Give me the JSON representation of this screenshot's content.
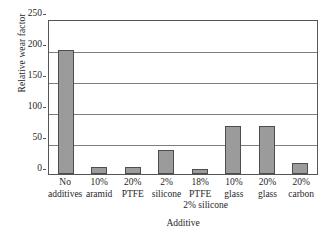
{
  "chart_data": {
    "type": "bar",
    "title": "",
    "xlabel": "Additive",
    "ylabel": "Relative wear factor",
    "categories": [
      "No additives",
      "10% aramid",
      "20% PTFE",
      "2% silicone",
      "18% PTFE 2% silicone",
      "10% glass",
      "20% glass",
      "20% carbon"
    ],
    "category_lines": [
      {
        "l1": "No",
        "l2": "additives",
        "l3": ""
      },
      {
        "l1": "10%",
        "l2": "aramid",
        "l3": ""
      },
      {
        "l1": "20%",
        "l2": "PTFE",
        "l3": ""
      },
      {
        "l1": "2%",
        "l2": "silicone",
        "l3": ""
      },
      {
        "l1": "18%",
        "l2": "PTFE",
        "l3": "2% silicone"
      },
      {
        "l1": "10%",
        "l2": "glass",
        "l3": ""
      },
      {
        "l1": "20%",
        "l2": "glass",
        "l3": ""
      },
      {
        "l1": "20%",
        "l2": "carbon",
        "l3": ""
      }
    ],
    "values": [
      200,
      12,
      12,
      38,
      8,
      78,
      78,
      17
    ],
    "ylim": [
      0,
      250
    ],
    "yticks": [
      0,
      50,
      100,
      150,
      200,
      250
    ],
    "ytick_labels": [
      "0",
      "50",
      "100",
      "150",
      "200",
      "250"
    ],
    "grid": true,
    "legend": "none",
    "bar_color": "#9b9b9b",
    "bar_edge_color": "#4d4d4d",
    "axis_color": "#555555",
    "gridline_color": "#7d7d7d"
  }
}
